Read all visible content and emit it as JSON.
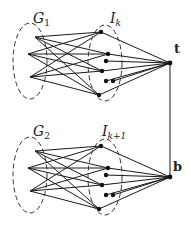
{
  "diagram": {
    "labels": {
      "g1": "G",
      "g1_sub": "1",
      "ik": "I",
      "ik_sub": "k",
      "g2": "G",
      "g2_sub": "2",
      "ik1": "I",
      "ik1_sub": "k+1",
      "t": "t",
      "b": "b"
    },
    "colors": {
      "edge": "#1a1a1a",
      "node": "#111111",
      "dash": "#333333"
    },
    "blocks": [
      {
        "name": "top",
        "g_nodes": [
          [
            35,
            37
          ],
          [
            28,
            54
          ],
          [
            30,
            77
          ]
        ],
        "i_nodes": [
          [
            101,
            32
          ],
          [
            108,
            54
          ],
          [
            106,
            61
          ],
          [
            102,
            71
          ],
          [
            106,
            81
          ],
          [
            113,
            81
          ],
          [
            99,
            95
          ]
        ],
        "hub": [
          170,
          63
        ]
      },
      {
        "name": "bottom",
        "g_nodes": [
          [
            35,
            151
          ],
          [
            28,
            168
          ],
          [
            30,
            191
          ]
        ],
        "i_nodes": [
          [
            101,
            146
          ],
          [
            108,
            168
          ],
          [
            106,
            175
          ],
          [
            102,
            185
          ],
          [
            106,
            195
          ],
          [
            113,
            195
          ],
          [
            99,
            209
          ]
        ],
        "hub": [
          170,
          177
        ]
      }
    ]
  }
}
